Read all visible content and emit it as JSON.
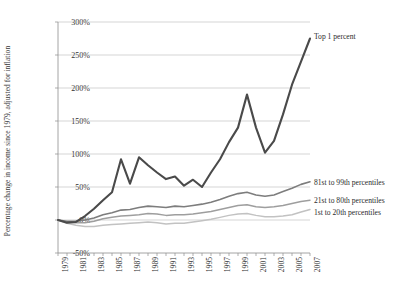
{
  "chart_data": {
    "type": "line",
    "title": "",
    "xlabel": "",
    "ylabel": "Percentage change in income since 1979, adjusted for inflation",
    "xlim": [
      1979,
      2007
    ],
    "ylim": [
      -50,
      300
    ],
    "ytick_labels": [
      "300%",
      "250%",
      "200%",
      "150%",
      "100%",
      "50%",
      "0%",
      "-50%"
    ],
    "ytick_values": [
      300,
      250,
      200,
      150,
      100,
      50,
      0,
      -50
    ],
    "grid": "horizontal",
    "legend_position": "right-inline",
    "x": [
      1979,
      1980,
      1981,
      1982,
      1983,
      1984,
      1985,
      1986,
      1987,
      1988,
      1989,
      1990,
      1991,
      1992,
      1993,
      1994,
      1995,
      1996,
      1997,
      1998,
      1999,
      2000,
      2001,
      2002,
      2003,
      2004,
      2005,
      2006,
      2007
    ],
    "xtick_labels": [
      "1979",
      "1981",
      "1983",
      "1985",
      "1987",
      "1989",
      "1991",
      "1993",
      "1995",
      "1997",
      "1999",
      "2001",
      "2003",
      "2005",
      "2007"
    ],
    "series": [
      {
        "name": "Top 1 percent",
        "color": "#4a4a4a",
        "width": 2.1,
        "label": "Top 1 percent",
        "values": [
          0,
          -4,
          -3,
          6,
          17,
          30,
          42,
          92,
          55,
          95,
          83,
          72,
          62,
          66,
          52,
          61,
          50,
          72,
          92,
          118,
          140,
          190,
          140,
          102,
          120,
          160,
          205,
          240,
          275
        ]
      },
      {
        "name": "81st to 99th percentiles",
        "color": "#7d7d7d",
        "width": 1.6,
        "label": "81st to 99th percentiles",
        "values": [
          0,
          -2,
          -2,
          0,
          3,
          8,
          11,
          15,
          16,
          19,
          21,
          20,
          19,
          21,
          20,
          22,
          24,
          27,
          31,
          36,
          40,
          42,
          38,
          36,
          38,
          43,
          48,
          54,
          58
        ]
      },
      {
        "name": "21st to 80th percentiles",
        "color": "#9e9e9e",
        "width": 1.5,
        "label": "21st to 80th percentiles",
        "values": [
          0,
          -3,
          -4,
          -4,
          -2,
          2,
          4,
          6,
          7,
          8,
          10,
          9,
          7,
          8,
          8,
          9,
          11,
          13,
          16,
          19,
          22,
          23,
          20,
          19,
          20,
          22,
          25,
          28,
          30
        ]
      },
      {
        "name": "1st to 20th percentiles",
        "color": "#c2c2c2",
        "width": 1.5,
        "label": "1st to 20th percentiles",
        "values": [
          0,
          -5,
          -8,
          -10,
          -10,
          -8,
          -7,
          -6,
          -5,
          -4,
          -3,
          -4,
          -6,
          -5,
          -5,
          -3,
          -1,
          1,
          4,
          7,
          9,
          10,
          7,
          5,
          5,
          6,
          8,
          12,
          16
        ]
      }
    ],
    "annotations": []
  }
}
